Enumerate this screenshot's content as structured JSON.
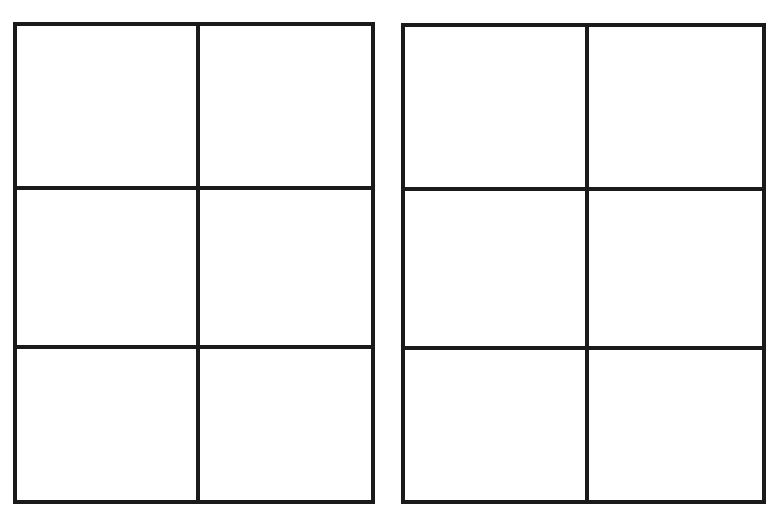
{
  "canvas": {
    "width": 779,
    "height": 515,
    "background": "#ffffff"
  },
  "line_color": "#1a1a1a",
  "line_width": 4,
  "grids": [
    {
      "name": "left-grid",
      "rows": 3,
      "cols": 2,
      "left": 13,
      "top": 22,
      "right": 375,
      "bottom": 504,
      "col_dividers": [
        196
      ],
      "row_dividers": [
        186,
        345
      ]
    },
    {
      "name": "right-grid",
      "rows": 3,
      "cols": 2,
      "left": 401,
      "top": 23,
      "right": 766,
      "bottom": 504,
      "col_dividers": [
        585
      ],
      "row_dividers": [
        187,
        346
      ]
    }
  ]
}
